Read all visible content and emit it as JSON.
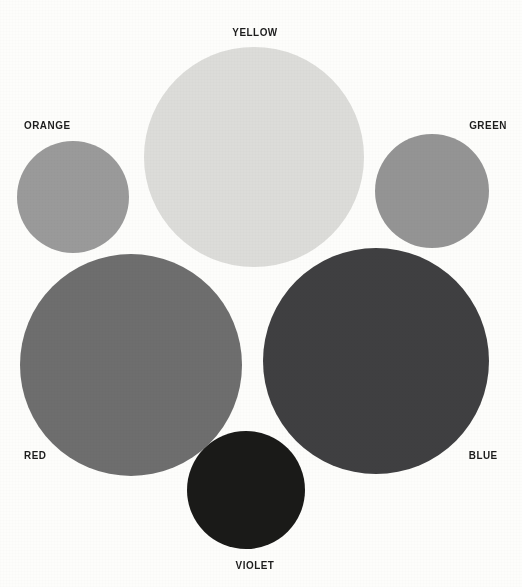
{
  "page": {
    "background_color": "#fdfdfb",
    "width": 522,
    "height": 587,
    "kind": "color-swatch-chart-grayscale"
  },
  "chart_data": {
    "type": "scatter",
    "title": "",
    "subtitle": "",
    "xlabel": "",
    "ylabel": "",
    "grid": false,
    "legend_position": "inline-labels",
    "note": "Six color swatches rendered as circles reproduced in grayscale; circle area encodes relative value/size and the fill gray encodes the color's tonal value.",
    "categories": [
      "ORANGE",
      "YELLOW",
      "GREEN",
      "RED",
      "BLUE",
      "VIOLET"
    ],
    "values": [
      56,
      110,
      57,
      111,
      113,
      59
    ],
    "value_unit": "radius_px",
    "fills": [
      "#9a9a9a",
      "#dcdcd9",
      "#949494",
      "#6e6e6e",
      "#3f3f41",
      "#1a1a18"
    ],
    "points": [
      {
        "label": "ORANGE",
        "cx": 73,
        "cy": 197,
        "r": 56,
        "fill": "#9a9a9a"
      },
      {
        "label": "YELLOW",
        "cx": 254,
        "cy": 157,
        "r": 110,
        "fill": "#dcdcd9"
      },
      {
        "label": "GREEN",
        "cx": 432,
        "cy": 191,
        "r": 57,
        "fill": "#949494"
      },
      {
        "label": "RED",
        "cx": 131,
        "cy": 365,
        "r": 111,
        "fill": "#6e6e6e"
      },
      {
        "label": "BLUE",
        "cx": 376,
        "cy": 361,
        "r": 113,
        "fill": "#3f3f41"
      },
      {
        "label": "VIOLET",
        "cx": 246,
        "cy": 490,
        "r": 59,
        "fill": "#1a1a18"
      }
    ]
  },
  "swatches": [
    {
      "id": "orange",
      "label": "ORANGE",
      "fill": "#9a9a9a",
      "cx": 73,
      "cy": 197,
      "r": 56,
      "left": 17,
      "top": 141,
      "size": 112,
      "label_left": 24,
      "label_top": 119,
      "label_align": "left"
    },
    {
      "id": "yellow",
      "label": "YELLOW",
      "fill": "#dcdcd9",
      "cx": 254,
      "cy": 157,
      "r": 110,
      "left": 144,
      "top": 47,
      "size": 220,
      "label_left": 255,
      "label_top": 26,
      "label_align": "center"
    },
    {
      "id": "green",
      "label": "GREEN",
      "fill": "#949494",
      "cx": 432,
      "cy": 191,
      "r": 57,
      "left": 375,
      "top": 134,
      "size": 114,
      "label_left": 507,
      "label_top": 119,
      "label_align": "right"
    },
    {
      "id": "red",
      "label": "RED",
      "fill": "#6e6e6e",
      "cx": 131,
      "cy": 365,
      "r": 111,
      "left": 20,
      "top": 254,
      "size": 222,
      "label_left": 24,
      "label_top": 449,
      "label_align": "left"
    },
    {
      "id": "blue",
      "label": "BLUE",
      "fill": "#3f3f41",
      "cx": 376,
      "cy": 361,
      "r": 113,
      "left": 263,
      "top": 248,
      "size": 226,
      "label_left": 498,
      "label_top": 449,
      "label_align": "right"
    },
    {
      "id": "violet",
      "label": "VIOLET",
      "fill": "#1a1a18",
      "cx": 246,
      "cy": 490,
      "r": 59,
      "left": 187,
      "top": 431,
      "size": 118,
      "label_left": 255,
      "label_top": 559,
      "label_align": "center"
    }
  ]
}
